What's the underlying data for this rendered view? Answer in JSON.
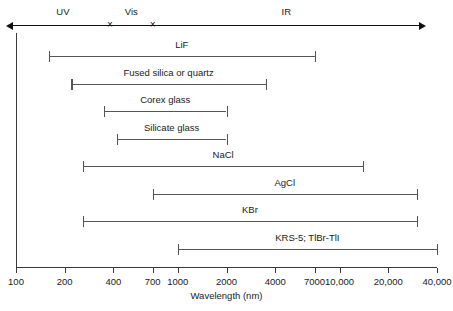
{
  "chart_data": {
    "type": "bar",
    "orientation": "horizontal-range",
    "title": "",
    "xlabel": "Wavelength (nm)",
    "ylabel": "",
    "xscale": "log",
    "xlim": [
      100,
      40000
    ],
    "grid": false,
    "tick_labels": [
      "100",
      "200",
      "400",
      "700",
      "1000",
      "2000",
      "4000",
      "7000",
      "10,000",
      "20,000",
      "40,000"
    ],
    "tick_values": [
      100,
      200,
      400,
      700,
      1000,
      2000,
      4000,
      7000,
      10000,
      20000,
      40000
    ],
    "categories": [
      "LiF",
      "Fused silica or quartz",
      "Corex glass",
      "Silicate glass",
      "NaCl",
      "AgCl",
      "KBr",
      "KRS-5; TlBr-TlI"
    ],
    "ranges": [
      {
        "label": "LiF",
        "start": 160,
        "end": 7000
      },
      {
        "label": "Fused silica or quartz",
        "start": 220,
        "end": 3500
      },
      {
        "label": "Corex glass",
        "start": 350,
        "end": 2000
      },
      {
        "label": "Silicate glass",
        "start": 420,
        "end": 2000
      },
      {
        "label": "NaCl",
        "start": 260,
        "end": 14000
      },
      {
        "label": "AgCl",
        "start": 700,
        "end": 30000
      },
      {
        "label": "KBr",
        "start": 260,
        "end": 30000
      },
      {
        "label": "KRS-5; TlBr-TlI",
        "start": 1000,
        "end": 40000
      }
    ],
    "regions": [
      {
        "label": "UV",
        "start": 100,
        "end": 380
      },
      {
        "label": "Vis",
        "start": 380,
        "end": 700
      },
      {
        "label": "IR",
        "start": 700,
        "end": 40000
      }
    ],
    "region_dividers": [
      380,
      700
    ],
    "colors": {
      "bar": "#555555",
      "axis": "#3a3a3a",
      "text": "#1a1a1a",
      "background": "#ffffff"
    }
  }
}
